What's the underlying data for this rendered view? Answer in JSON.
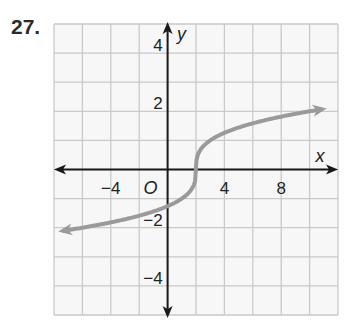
{
  "problem": {
    "number": "27."
  },
  "chart_data": {
    "type": "line",
    "title": "",
    "xlabel": "x",
    "ylabel": "y",
    "origin_label": "O",
    "xlim": [
      -8,
      12
    ],
    "ylim": [
      -5,
      5
    ],
    "grid": true,
    "grid_step_x": 2,
    "grid_step_y": 1,
    "x_ticks": [
      {
        "value": -4,
        "label": "−4"
      },
      {
        "value": 4,
        "label": "4"
      },
      {
        "value": 8,
        "label": "8"
      }
    ],
    "y_ticks": [
      {
        "value": 4,
        "label": "4"
      },
      {
        "value": 2,
        "label": "2"
      },
      {
        "value": -2,
        "label": "−2"
      },
      {
        "value": -4,
        "label": "−4"
      }
    ],
    "series": [
      {
        "name": "curve",
        "function": "y = cbrt(x - 2)",
        "color": "#9a9a9a",
        "arrows": "both",
        "x": [
          -7.7,
          -6,
          -4,
          -2,
          0,
          1,
          1.5,
          2,
          2.5,
          3,
          4,
          6,
          8,
          10,
          11.2
        ],
        "y": [
          -2.13,
          -2.0,
          -1.82,
          -1.59,
          -1.26,
          -1.0,
          -0.79,
          0,
          0.79,
          1.0,
          1.26,
          1.59,
          1.82,
          2.0,
          2.1
        ]
      }
    ]
  },
  "colors": {
    "grid": "#c9c9c9",
    "grid_bg": "#f7f7f7",
    "axis": "#1a1a1a",
    "curve": "#9a9a9a"
  }
}
